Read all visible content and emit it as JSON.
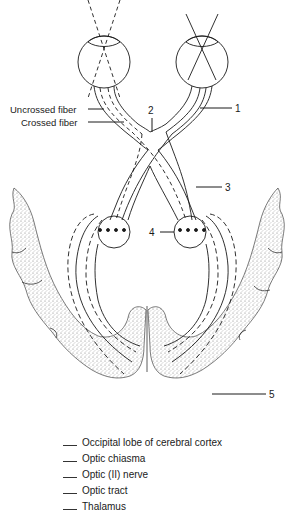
{
  "figure": {
    "type": "labeled anatomical diagram",
    "colors": {
      "ink": "#1a1a1a",
      "stipple": "#8a8a8a",
      "background": "#ffffff"
    }
  },
  "side_labels": {
    "uncrossed_fiber": "Uncrossed fiber",
    "crossed_fiber": "Crossed fiber"
  },
  "callouts": [
    {
      "number": "1",
      "target": "optic nerve"
    },
    {
      "number": "2",
      "target": "optic chiasma"
    },
    {
      "number": "3",
      "target": "optic tract"
    },
    {
      "number": "4",
      "target": "thalamus"
    },
    {
      "number": "5",
      "target": "occipital lobe"
    }
  ],
  "answer_key": {
    "blank": "___",
    "items": [
      "Occipital lobe of cerebral cortex",
      "Optic chiasma",
      "Optic (II) nerve",
      "Optic tract",
      "Thalamus"
    ]
  }
}
